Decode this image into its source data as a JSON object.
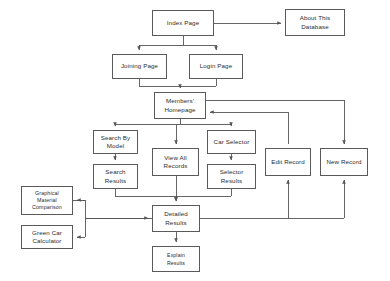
{
  "diagram": {
    "background": "#ffffff",
    "line_color": "#555555",
    "box_border": "#5a5a5a",
    "nodes": [
      {
        "id": "index-page",
        "label": "Index Page",
        "x": 152,
        "y": 10,
        "w": 62,
        "h": 26
      },
      {
        "id": "about-this-db",
        "label": "About This\nDatabase",
        "x": 285,
        "y": 9,
        "w": 60,
        "h": 27
      },
      {
        "id": "joining-page",
        "label": "Joining Page",
        "x": 112,
        "y": 54,
        "w": 55,
        "h": 25
      },
      {
        "id": "login-page",
        "label": "Login Page",
        "x": 189,
        "y": 54,
        "w": 54,
        "h": 25
      },
      {
        "id": "members-homepage",
        "label": "Members'\nHomepage",
        "x": 154,
        "y": 92,
        "w": 52,
        "h": 27
      },
      {
        "id": "search-by-model",
        "label": "Search By\nModel",
        "x": 93,
        "y": 130,
        "w": 45,
        "h": 24
      },
      {
        "id": "view-all-records",
        "label": "View All\nRecords",
        "x": 152,
        "y": 148,
        "w": 47,
        "h": 28
      },
      {
        "id": "car-selector",
        "label": "Car Selector",
        "x": 207,
        "y": 130,
        "w": 49,
        "h": 24
      },
      {
        "id": "edit-record",
        "label": "Edit Record",
        "x": 265,
        "y": 148,
        "w": 46,
        "h": 28
      },
      {
        "id": "new-record",
        "label": "New Record",
        "x": 320,
        "y": 148,
        "w": 48,
        "h": 28
      },
      {
        "id": "search-results",
        "label": "Search\nResults",
        "x": 93,
        "y": 164,
        "w": 45,
        "h": 25
      },
      {
        "id": "selector-results",
        "label": "Selector\nResults",
        "x": 207,
        "y": 164,
        "w": 49,
        "h": 25
      },
      {
        "id": "graphical-material",
        "label": "Graphical\nMaterial\nComparison",
        "x": 21,
        "y": 186,
        "w": 52,
        "h": 29
      },
      {
        "id": "green-car-calc",
        "label": "Green Car\nCalculator",
        "x": 21,
        "y": 225,
        "w": 52,
        "h": 24
      },
      {
        "id": "detailed-results",
        "label": "Detailed\nResults",
        "x": 152,
        "y": 205,
        "w": 48,
        "h": 27
      },
      {
        "id": "explain-results",
        "label": "Explain\nResults",
        "x": 152,
        "y": 246,
        "w": 48,
        "h": 26
      }
    ],
    "edges": [
      {
        "from": "index-page",
        "to": "about-this-db",
        "kind": "horizontal-right"
      },
      {
        "from": "index-page",
        "to": "joining-page",
        "kind": "split-down-left"
      },
      {
        "from": "index-page",
        "to": "login-page",
        "kind": "split-down-right"
      },
      {
        "from": "joining-page",
        "to": "members-homepage",
        "kind": "merge-down"
      },
      {
        "from": "login-page",
        "to": "members-homepage",
        "kind": "merge-down"
      },
      {
        "from": "members-homepage",
        "to": "search-by-model",
        "kind": "fan-down-left"
      },
      {
        "from": "members-homepage",
        "to": "view-all-records",
        "kind": "fan-down"
      },
      {
        "from": "members-homepage",
        "to": "car-selector",
        "kind": "fan-down-right"
      },
      {
        "from": "members-homepage",
        "to": "new-record",
        "kind": "right-around"
      },
      {
        "from": "edit-record",
        "to": "members-homepage",
        "kind": "left-return"
      },
      {
        "from": "search-by-model",
        "to": "search-results",
        "kind": "vertical"
      },
      {
        "from": "car-selector",
        "to": "selector-results",
        "kind": "vertical"
      },
      {
        "from": "search-results",
        "to": "detailed-results",
        "kind": "elbow-right"
      },
      {
        "from": "view-all-records",
        "to": "detailed-results",
        "kind": "vertical"
      },
      {
        "from": "selector-results",
        "to": "detailed-results",
        "kind": "elbow-left"
      },
      {
        "from": "detailed-results",
        "to": "explain-results",
        "kind": "vertical"
      },
      {
        "from": "detailed-results",
        "to": "graphical-material",
        "kind": "elbow-left-up"
      },
      {
        "from": "detailed-results",
        "to": "green-car-calc",
        "kind": "elbow-left-down"
      },
      {
        "from": "graphical-material",
        "to": "detailed-results",
        "kind": "elbow-right-in"
      },
      {
        "from": "detailed-results",
        "to": "edit-record",
        "kind": "up-right"
      },
      {
        "from": "detailed-results",
        "to": "new-record",
        "kind": "up-right"
      }
    ]
  }
}
